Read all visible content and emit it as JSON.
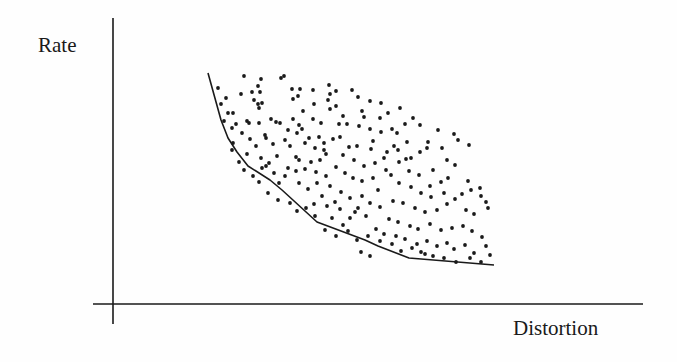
{
  "chart_data": {
    "type": "scatter",
    "title": "",
    "xlabel": "Distortion",
    "ylabel": "Rate",
    "grid": false,
    "legend": null,
    "ticks": {
      "x": [],
      "y": []
    },
    "note": "Operational rate-distortion plot: scattered achievable (distortion, rate) points with lower convex hull boundary. Coordinates in image pixel space.",
    "colors": {
      "points": "#1a1a1a",
      "hull": "#1a1a1a",
      "axes": "#1a1a1a"
    },
    "axes": {
      "y_axis": {
        "x": 113,
        "y1": 18,
        "y2": 324
      },
      "x_axis": {
        "y": 304,
        "x1": 93,
        "x2": 643
      }
    },
    "hull": [
      [
        208,
        73
      ],
      [
        221,
        120
      ],
      [
        228,
        138
      ],
      [
        237,
        152
      ],
      [
        248,
        166
      ],
      [
        270,
        180
      ],
      [
        282,
        190
      ],
      [
        317,
        222
      ],
      [
        365,
        240
      ],
      [
        378,
        246
      ],
      [
        409,
        258
      ],
      [
        494,
        265
      ]
    ],
    "points": [
      [
        244,
        76
      ],
      [
        261,
        79
      ],
      [
        281,
        78
      ],
      [
        284,
        76
      ],
      [
        292,
        89
      ],
      [
        300,
        89
      ],
      [
        329,
        85
      ],
      [
        336,
        91
      ],
      [
        226,
        98
      ],
      [
        241,
        94
      ],
      [
        252,
        92
      ],
      [
        260,
        92
      ],
      [
        258,
        86
      ],
      [
        254,
        100
      ],
      [
        258,
        104
      ],
      [
        262,
        103
      ],
      [
        259,
        108
      ],
      [
        293,
        99
      ],
      [
        298,
        96
      ],
      [
        313,
        90
      ],
      [
        314,
        104
      ],
      [
        328,
        100
      ],
      [
        330,
        94
      ],
      [
        330,
        109
      ],
      [
        303,
        111
      ],
      [
        233,
        113
      ],
      [
        224,
        121
      ],
      [
        236,
        124
      ],
      [
        247,
        121
      ],
      [
        249,
        123
      ],
      [
        259,
        123
      ],
      [
        271,
        119
      ],
      [
        276,
        122
      ],
      [
        280,
        123
      ],
      [
        293,
        119
      ],
      [
        313,
        119
      ],
      [
        321,
        123
      ],
      [
        265,
        135
      ],
      [
        266,
        138
      ],
      [
        233,
        143
      ],
      [
        256,
        146
      ],
      [
        290,
        146
      ],
      [
        297,
        133
      ],
      [
        302,
        129
      ],
      [
        319,
        137
      ],
      [
        305,
        143
      ],
      [
        324,
        143
      ],
      [
        333,
        139
      ],
      [
        324,
        150
      ],
      [
        277,
        156
      ],
      [
        296,
        157
      ],
      [
        326,
        154
      ],
      [
        352,
        90
      ],
      [
        358,
        97
      ],
      [
        370,
        101
      ],
      [
        381,
        103
      ],
      [
        336,
        106
      ],
      [
        362,
        111
      ],
      [
        364,
        117
      ],
      [
        343,
        116
      ],
      [
        347,
        124
      ],
      [
        359,
        126
      ],
      [
        370,
        129
      ],
      [
        381,
        132
      ],
      [
        373,
        141
      ],
      [
        392,
        129
      ],
      [
        397,
        133
      ],
      [
        340,
        137
      ],
      [
        349,
        147
      ],
      [
        357,
        146
      ],
      [
        371,
        149
      ],
      [
        387,
        152
      ],
      [
        394,
        146
      ],
      [
        354,
        160
      ],
      [
        364,
        166
      ],
      [
        375,
        163
      ],
      [
        384,
        158
      ],
      [
        399,
        162
      ],
      [
        406,
        159
      ],
      [
        420,
        152
      ],
      [
        427,
        148
      ],
      [
        409,
        171
      ],
      [
        419,
        175
      ],
      [
        433,
        170
      ],
      [
        447,
        160
      ],
      [
        455,
        165
      ],
      [
        441,
        182
      ],
      [
        448,
        178
      ],
      [
        430,
        186
      ],
      [
        468,
        181
      ],
      [
        480,
        188
      ],
      [
        413,
        118
      ],
      [
        420,
        125
      ],
      [
        438,
        130
      ],
      [
        428,
        142
      ],
      [
        454,
        134
      ],
      [
        458,
        140
      ],
      [
        469,
        145
      ],
      [
        442,
        148
      ],
      [
        345,
        173
      ],
      [
        353,
        178
      ],
      [
        362,
        181
      ],
      [
        373,
        178
      ],
      [
        391,
        175
      ],
      [
        399,
        183
      ],
      [
        411,
        187
      ],
      [
        421,
        193
      ],
      [
        431,
        197
      ],
      [
        444,
        193
      ],
      [
        455,
        199
      ],
      [
        462,
        194
      ],
      [
        471,
        190
      ],
      [
        481,
        196
      ],
      [
        486,
        202
      ],
      [
        488,
        208
      ],
      [
        341,
        192
      ],
      [
        350,
        198
      ],
      [
        362,
        196
      ],
      [
        370,
        203
      ],
      [
        380,
        207
      ],
      [
        393,
        201
      ],
      [
        403,
        203
      ],
      [
        415,
        208
      ],
      [
        425,
        212
      ],
      [
        437,
        210
      ],
      [
        447,
        204
      ],
      [
        466,
        210
      ],
      [
        474,
        214
      ],
      [
        355,
        212
      ],
      [
        366,
        216
      ],
      [
        389,
        219
      ],
      [
        398,
        222
      ],
      [
        410,
        226
      ],
      [
        418,
        229
      ],
      [
        430,
        224
      ],
      [
        441,
        230
      ],
      [
        452,
        228
      ],
      [
        463,
        226
      ],
      [
        472,
        231
      ],
      [
        332,
        218
      ],
      [
        343,
        225
      ],
      [
        376,
        229
      ],
      [
        384,
        234
      ],
      [
        396,
        236
      ],
      [
        405,
        239
      ],
      [
        417,
        244
      ],
      [
        427,
        241
      ],
      [
        437,
        246
      ],
      [
        447,
        243
      ],
      [
        454,
        249
      ],
      [
        465,
        245
      ],
      [
        474,
        253
      ],
      [
        482,
        237
      ],
      [
        486,
        246
      ],
      [
        490,
        255
      ],
      [
        425,
        254
      ],
      [
        433,
        256
      ],
      [
        444,
        258
      ],
      [
        456,
        262
      ],
      [
        470,
        258
      ],
      [
        481,
        262
      ],
      [
        288,
        168
      ],
      [
        296,
        171
      ],
      [
        305,
        169
      ],
      [
        274,
        173
      ],
      [
        266,
        166
      ],
      [
        279,
        183
      ],
      [
        285,
        176
      ],
      [
        299,
        183
      ],
      [
        308,
        189
      ],
      [
        317,
        183
      ],
      [
        322,
        196
      ],
      [
        314,
        204
      ],
      [
        327,
        206
      ],
      [
        335,
        202
      ],
      [
        340,
        209
      ],
      [
        232,
        128
      ],
      [
        242,
        133
      ],
      [
        250,
        139
      ],
      [
        261,
        158
      ],
      [
        269,
        163
      ],
      [
        239,
        162
      ],
      [
        244,
        170
      ],
      [
        253,
        176
      ],
      [
        259,
        182
      ],
      [
        268,
        193
      ],
      [
        278,
        200
      ],
      [
        290,
        203
      ],
      [
        297,
        211
      ],
      [
        306,
        208
      ],
      [
        315,
        216
      ],
      [
        325,
        230
      ],
      [
        336,
        236
      ],
      [
        348,
        231
      ],
      [
        357,
        240
      ],
      [
        368,
        236
      ],
      [
        380,
        241
      ],
      [
        392,
        244
      ],
      [
        401,
        251
      ],
      [
        412,
        248
      ],
      [
        421,
        252
      ],
      [
        361,
        252
      ],
      [
        370,
        256
      ],
      [
        218,
        88
      ],
      [
        221,
        104
      ],
      [
        228,
        113
      ],
      [
        232,
        150
      ],
      [
        247,
        154
      ],
      [
        262,
        168
      ],
      [
        273,
        144
      ],
      [
        285,
        140
      ],
      [
        288,
        130
      ],
      [
        299,
        125
      ],
      [
        309,
        138
      ],
      [
        315,
        148
      ],
      [
        339,
        124
      ],
      [
        343,
        155
      ],
      [
        336,
        167
      ],
      [
        316,
        172
      ],
      [
        326,
        176
      ],
      [
        330,
        186
      ],
      [
        380,
        118
      ],
      [
        388,
        113
      ],
      [
        400,
        108
      ],
      [
        405,
        124
      ],
      [
        407,
        142
      ],
      [
        398,
        150
      ],
      [
        411,
        158
      ],
      [
        386,
        170
      ],
      [
        378,
        190
      ],
      [
        358,
        208
      ],
      [
        350,
        218
      ],
      [
        320,
        160
      ],
      [
        311,
        162
      ],
      [
        299,
        160
      ]
    ]
  }
}
